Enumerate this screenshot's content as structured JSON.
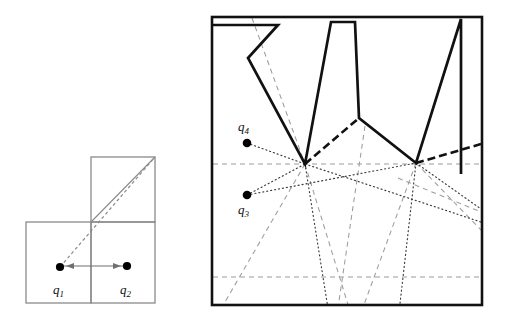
{
  "figure": {
    "title": "",
    "panels": [
      {
        "id": "left-panel",
        "name": "nested-squares-diagram",
        "description": "Two axis-aligned squares forming an L-shape with two query points joined by a double arrow and a dashed diagonal",
        "labels": [
          {
            "id": "q1",
            "base": "q",
            "sub": "1",
            "x": 53,
            "y": 294
          },
          {
            "id": "q2",
            "base": "q",
            "sub": "2",
            "x": 120,
            "y": 294
          }
        ],
        "points": [
          {
            "id": "q1",
            "x": 60,
            "y": 267
          },
          {
            "id": "q2",
            "x": 127,
            "y": 266
          }
        ],
        "squares": [
          {
            "id": "upper-right-square",
            "x": 91,
            "y": 157,
            "w": 64,
            "h": 65
          },
          {
            "id": "lower-left-square",
            "x": 26,
            "y": 222,
            "w": 65,
            "h": 81
          },
          {
            "id": "lower-right-square",
            "x": 91,
            "y": 222,
            "w": 64,
            "h": 81
          }
        ],
        "diagonal": {
          "x1": 91,
          "y1": 222,
          "x2": 155,
          "y2": 157
        },
        "dashed_ray": {
          "x1": 60,
          "y1": 267,
          "x2": 155,
          "y2": 157
        },
        "arrow": {
          "x1": 60,
          "y1": 266,
          "x2": 127,
          "y2": 266,
          "style": "double-headed"
        }
      },
      {
        "id": "right-panel",
        "name": "zigzag-polygon-visibility-diagram",
        "description": "Bounding rectangle containing a thick zigzag polyline with three downward spikes, dotted visibility rays from two query points, dashed bisector lines and two horizontal dashed gridlines",
        "bounds": {
          "x": 212,
          "y": 17,
          "w": 270,
          "h": 288
        },
        "labels": [
          {
            "id": "q4",
            "base": "q",
            "sub": "4",
            "x": 238,
            "y": 131
          },
          {
            "id": "q3",
            "base": "q",
            "sub": "3",
            "x": 238,
            "y": 214
          }
        ],
        "points": [
          {
            "id": "q4",
            "x": 247,
            "y": 143
          },
          {
            "id": "q3",
            "x": 247,
            "y": 195
          }
        ],
        "gridlines": [
          {
            "id": "upper-gridline",
            "y": 164
          },
          {
            "id": "lower-gridline",
            "y": 277
          }
        ],
        "zigzag_vertices": [
          {
            "x": 212,
            "y": 25
          },
          {
            "x": 278,
            "y": 25
          },
          {
            "x": 248,
            "y": 58
          },
          {
            "x": 305,
            "y": 164
          },
          {
            "x": 331,
            "y": 22
          },
          {
            "x": 355,
            "y": 22
          },
          {
            "x": 359,
            "y": 118
          },
          {
            "x": 416,
            "y": 163
          },
          {
            "x": 461,
            "y": 19
          },
          {
            "x": 461,
            "y": 174
          }
        ],
        "thick_dashed_segments": [
          {
            "x1": 305,
            "y1": 164,
            "x2": 359,
            "y2": 118
          },
          {
            "x1": 416,
            "y1": 163,
            "x2": 482,
            "y2": 144
          }
        ]
      }
    ],
    "colors": {
      "stroke_dark": "#111111",
      "stroke_light": "#8a8a8a",
      "dot_fill": "#000000",
      "background": "#ffffff"
    }
  }
}
